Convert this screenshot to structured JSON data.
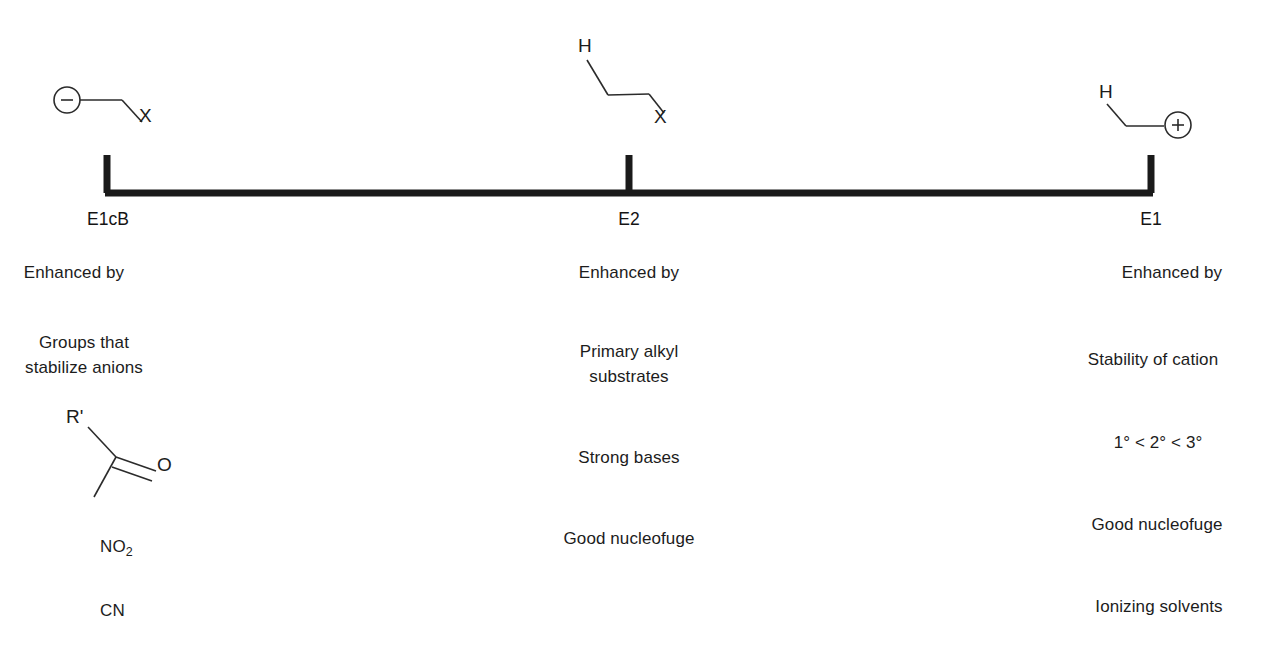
{
  "diagram": {
    "axis": {
      "line_color": "#1a1a1a",
      "left_label": "E1cB",
      "middle_label": "E2",
      "right_label": "E1"
    },
    "columns": [
      {
        "id": "e1cb",
        "axis_label": "E1cB",
        "structure": {
          "name": "carbanion-leaving-group",
          "charge_glyph": "−",
          "atom_labels": [
            "X"
          ]
        },
        "rows": [
          {
            "kind": "text",
            "lines": [
              "Enhanced by"
            ]
          },
          {
            "kind": "text",
            "lines": [
              "Groups that",
              "stabilize anions"
            ]
          },
          {
            "kind": "structure",
            "name": "carbonyl",
            "atom_labels": [
              "R'",
              "O"
            ]
          },
          {
            "kind": "formula",
            "base": "NO",
            "subscript": "2"
          },
          {
            "kind": "text",
            "lines": [
              "CN"
            ]
          }
        ]
      },
      {
        "id": "e2",
        "axis_label": "E2",
        "structure": {
          "name": "anti-periplanar-h-c-c-x",
          "atom_labels": [
            "H",
            "X"
          ]
        },
        "rows": [
          {
            "kind": "text",
            "lines": [
              "Enhanced by"
            ]
          },
          {
            "kind": "text",
            "lines": [
              "Primary alkyl",
              "substrates"
            ]
          },
          {
            "kind": "text",
            "lines": [
              "Strong bases"
            ]
          },
          {
            "kind": "text",
            "lines": [
              "Good nucleofuge"
            ]
          }
        ]
      },
      {
        "id": "e1",
        "axis_label": "E1",
        "structure": {
          "name": "carbocation-with-beta-hydrogen",
          "charge_glyph": "+",
          "atom_labels": [
            "H"
          ]
        },
        "rows": [
          {
            "kind": "text",
            "lines": [
              "Enhanced by"
            ]
          },
          {
            "kind": "text",
            "lines": [
              "Stability of cation"
            ]
          },
          {
            "kind": "text",
            "lines": [
              "1° < 2° < 3°"
            ]
          },
          {
            "kind": "text",
            "lines": [
              "Good nucleofuge"
            ]
          },
          {
            "kind": "text",
            "lines": [
              "Ionizing solvents"
            ]
          }
        ]
      }
    ],
    "text_blocks": {
      "e1cb_enhanced": "Enhanced by",
      "e1cb_groups_line1": "Groups that",
      "e1cb_groups_line2": "stabilize anions",
      "e1cb_no2_base": "NO",
      "e1cb_no2_sub": "2",
      "e1cb_cn": "CN",
      "e1cb_r_prime": "R'",
      "e1cb_oxygen": "O",
      "e1cb_x": "X",
      "e2_enhanced": "Enhanced by",
      "e2_primary_line1": "Primary alkyl",
      "e2_primary_line2": "substrates",
      "e2_strong_bases": "Strong bases",
      "e2_good_nucleofuge": "Good nucleofuge",
      "e2_h": "H",
      "e2_x": "X",
      "e1_enhanced": "Enhanced by",
      "e1_stability": "Stability of cation",
      "e1_degrees": "1° < 2° < 3°",
      "e1_good_nucleofuge": "Good nucleofuge",
      "e1_ionizing_solvents": "Ionizing solvents",
      "e1_h": "H"
    }
  }
}
